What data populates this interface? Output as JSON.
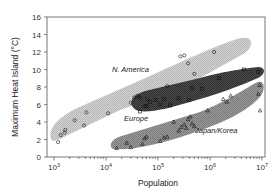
{
  "chart_data": {
    "type": "scatter",
    "title": "",
    "xlabel": "Population",
    "ylabel": "Maximum Heat Island (°C)",
    "xscale": "log",
    "xlim": [
      1000,
      10000000
    ],
    "ylim": [
      0,
      16
    ],
    "x_ticks": [
      {
        "base": "10",
        "exp": "3"
      },
      {
        "base": "10",
        "exp": "4"
      },
      {
        "base": "10",
        "exp": "5"
      },
      {
        "base": "10",
        "exp": "6"
      },
      {
        "base": "10",
        "exp": "7"
      }
    ],
    "y_ticks": [
      "0",
      "2",
      "4",
      "6",
      "8",
      "10",
      "12",
      "14",
      "16"
    ],
    "grid": false,
    "legend": "none (regions labeled inline)",
    "series": [
      {
        "name": "N. America",
        "marker": "circle",
        "region_fill": "#c8c8c8",
        "points": [
          [
            1200,
            1.7
          ],
          [
            1350,
            2.5
          ],
          [
            1600,
            2.8
          ],
          [
            1650,
            3.1
          ],
          [
            2500,
            4.2
          ],
          [
            3800,
            3.6
          ],
          [
            4200,
            5.1
          ],
          [
            11000,
            5.0
          ],
          [
            30000,
            6.2
          ],
          [
            35000,
            6.8
          ],
          [
            40000,
            7.0
          ],
          [
            45000,
            6.8
          ],
          [
            55000,
            5.8
          ],
          [
            62000,
            6.6
          ],
          [
            150000,
            8.1
          ],
          [
            270000,
            11.5
          ],
          [
            320000,
            11.6
          ],
          [
            380000,
            10.7
          ],
          [
            500000,
            9.5
          ],
          [
            1200000,
            12.0
          ]
        ]
      },
      {
        "name": "Europe",
        "marker": "square",
        "region_fill": "#404040",
        "points": [
          [
            45000,
            5.2
          ],
          [
            60000,
            5.8
          ],
          [
            70000,
            6.3
          ],
          [
            90000,
            6.5
          ],
          [
            110000,
            6.0
          ],
          [
            130000,
            6.6
          ],
          [
            170000,
            5.9
          ],
          [
            250000,
            6.7
          ],
          [
            400000,
            6.5
          ],
          [
            450000,
            7.9
          ],
          [
            700000,
            7.8
          ],
          [
            1500000,
            9.0
          ],
          [
            4500000,
            10.0
          ],
          [
            8500000,
            9.7
          ]
        ]
      },
      {
        "name": "Japan/Korea",
        "marker": "triangle",
        "region_fill": "#8c8c8c",
        "points": [
          [
            16000,
            1.0
          ],
          [
            25000,
            1.6
          ],
          [
            30000,
            1.1
          ],
          [
            50000,
            1.5
          ],
          [
            55000,
            2.1
          ],
          [
            60000,
            2.3
          ],
          [
            110000,
            1.8
          ],
          [
            130000,
            2.2
          ],
          [
            150000,
            2.3
          ],
          [
            200000,
            4.0
          ],
          [
            250000,
            3.0
          ],
          [
            280000,
            3.4
          ],
          [
            320000,
            3.7
          ],
          [
            350000,
            3.3
          ],
          [
            380000,
            4.3
          ],
          [
            420000,
            4.6
          ],
          [
            450000,
            3.8
          ],
          [
            500000,
            3.5
          ],
          [
            900000,
            5.3
          ],
          [
            1800000,
            6.6
          ],
          [
            2100000,
            6.3
          ],
          [
            2500000,
            7.0
          ],
          [
            8500000,
            7.2
          ],
          [
            9000000,
            8.2
          ],
          [
            9200000,
            5.3
          ]
        ]
      }
    ],
    "annotations": [
      {
        "text": "N. America",
        "x": 30000,
        "y": 9.0
      },
      {
        "text": "Europe",
        "x": 50000,
        "y": 4.3
      },
      {
        "text": "Japan/Korea",
        "x": 1400000,
        "y": 3.2
      }
    ]
  },
  "labels": {
    "ylabel": "Maximum Heat Island (°C)",
    "xlabel": "Population",
    "region_na": "N. America",
    "region_eu": "Europe",
    "region_jk": "Japan/Korea",
    "y0": "0",
    "y2": "2",
    "y4": "4",
    "y6": "6",
    "y8": "8",
    "y10": "10",
    "y12": "12",
    "y14": "14",
    "y16": "16",
    "x3_base": "10",
    "x3_exp": "3",
    "x4_base": "10",
    "x4_exp": "4",
    "x5_base": "10",
    "x5_exp": "5",
    "x6_base": "10",
    "x6_exp": "6",
    "x7_base": "10",
    "x7_exp": "7"
  }
}
